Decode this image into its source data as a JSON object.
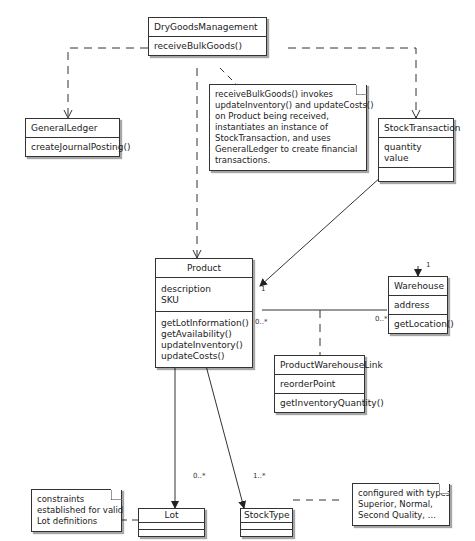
{
  "classes": {
    "dry_goods_management": {
      "name": "DryGoodsManagement",
      "attributes": [],
      "operations": [
        "receiveBulkGoods()"
      ]
    },
    "general_ledger": {
      "name": "GeneralLedger",
      "attributes": [],
      "operations": [
        "createJournalPosting()"
      ]
    },
    "stock_transaction": {
      "name": "StockTransaction",
      "attributes": [
        "quantity",
        "value"
      ],
      "operations": []
    },
    "product": {
      "name": "Product",
      "attributes": [
        "description",
        "SKU"
      ],
      "operations": [
        "getLotInformation()",
        "getAvailability()",
        "updateInventory()",
        "updateCosts()"
      ]
    },
    "warehouse": {
      "name": "Warehouse",
      "attributes": [
        "address"
      ],
      "operations": [
        "getLocation()"
      ]
    },
    "product_warehouse_link": {
      "name": "ProductWarehouseLink",
      "attributes": [
        "reorderPoint"
      ],
      "operations": [
        "getInventoryQuantity()"
      ]
    },
    "lot": {
      "name": "Lot",
      "attributes": [],
      "operations": []
    },
    "stock_type": {
      "name": "StockType",
      "attributes": [],
      "operations": []
    }
  },
  "notes": {
    "receive_note": [
      "receiveBulkGoods()  invokes",
      "updateInventory()  and updateCosts()",
      "on Product being received,",
      "instantiates an instance of",
      "StockTransaction, and uses",
      "GeneralLedger to create financial",
      "transactions."
    ],
    "lot_note": [
      "constraints",
      "established for valid",
      "Lot definitions"
    ],
    "stocktype_note": [
      "configured with types",
      "Superior, Normal,",
      "Second Quality, ..."
    ]
  },
  "multiplicities": {
    "product_stocktransaction": "1",
    "product_warehouse": "0..*",
    "warehouse_product": "0..*",
    "warehouse_top": "1",
    "lot": "0..*",
    "stock_type": "1..*"
  }
}
